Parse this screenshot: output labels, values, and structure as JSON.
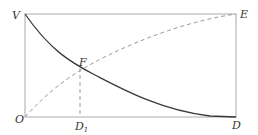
{
  "diagram": {
    "labels": {
      "V": "V",
      "E": "E",
      "O": "O",
      "D": "D",
      "F": "F",
      "D1_main": "D",
      "D1_sub": "1"
    },
    "colors": {
      "frame": "#aaaaaa",
      "solid_curve": "#3a3a3a",
      "dashed_curve": "#9a9a9a",
      "text": "#333333"
    },
    "elements": [
      {
        "name": "rectangle-frame",
        "corners": [
          "O",
          "D",
          "E",
          "V"
        ]
      },
      {
        "name": "solid-curve",
        "from": "V",
        "to": "D",
        "shape": "decreasing, concave up"
      },
      {
        "name": "dashed-curve",
        "from": "O",
        "to": "E",
        "shape": "increasing, concave down"
      },
      {
        "name": "intersection-point",
        "label": "F"
      },
      {
        "name": "dashed-drop-line",
        "from": "F",
        "to": "D1"
      }
    ]
  }
}
